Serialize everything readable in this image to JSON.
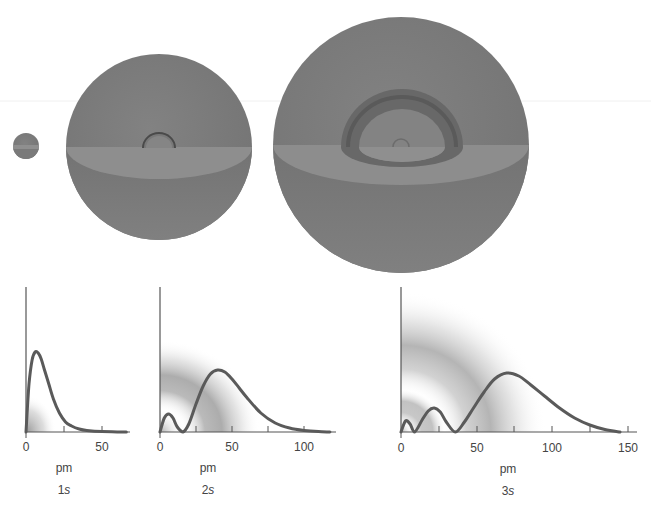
{
  "figure": {
    "colors": {
      "sphere": "#7d7d7d",
      "sphere_cut": "#8f8f8f",
      "sphere_shadow": "#5f5f5f",
      "curve": "#5a5a5a",
      "axis": "#555555",
      "text": "#444444"
    }
  },
  "orbitals": [
    {
      "id": "1s",
      "n": "1",
      "l": "s",
      "sphere": {
        "cx": 26,
        "cy": 146,
        "r": 13
      }
    },
    {
      "id": "2s",
      "n": "2",
      "l": "s",
      "sphere": {
        "cx": 159,
        "cy": 147,
        "r": 93
      }
    },
    {
      "id": "3s",
      "n": "3",
      "l": "s",
      "sphere": {
        "cx": 401,
        "cy": 145,
        "r": 128
      }
    }
  ],
  "chart_data": [
    {
      "type": "line",
      "title": "1s",
      "xlabel": "pm",
      "ylabel": "",
      "xticks": [
        0,
        25,
        50
      ],
      "xtick_labels": [
        "0",
        "",
        "50"
      ],
      "xlim": [
        0,
        68
      ],
      "x": [
        0,
        2,
        4,
        6,
        8,
        10,
        12,
        15,
        18,
        22,
        26,
        30,
        35,
        40,
        50,
        60,
        66
      ],
      "values": [
        0,
        48,
        72,
        80,
        79,
        73,
        63,
        48,
        33,
        19,
        10,
        6,
        3,
        1.5,
        0.4,
        0.1,
        0
      ],
      "grid": false,
      "legend": null
    },
    {
      "type": "line",
      "title": "2s",
      "xlabel": "pm",
      "ylabel": "",
      "xticks": [
        0,
        25,
        50,
        75,
        100
      ],
      "xtick_labels": [
        "0",
        "",
        "50",
        "",
        "100"
      ],
      "xlim": [
        0,
        122
      ],
      "x": [
        0,
        3,
        6,
        9,
        12,
        16,
        20,
        25,
        30,
        35,
        40,
        45,
        50,
        55,
        60,
        70,
        80,
        90,
        100,
        110,
        118
      ],
      "values": [
        0,
        14,
        18,
        14,
        5,
        0,
        8,
        28,
        46,
        58,
        62,
        60,
        53,
        44,
        35,
        19,
        9,
        4,
        1.5,
        0.4,
        0
      ],
      "grid": false,
      "legend": null
    },
    {
      "type": "line",
      "title": "3s",
      "xlabel": "pm",
      "ylabel": "",
      "xticks": [
        0,
        25,
        50,
        75,
        100,
        125,
        150
      ],
      "xtick_labels": [
        "0",
        "",
        "50",
        "",
        "100",
        "",
        "150"
      ],
      "xlim": [
        0,
        157
      ],
      "x": [
        0,
        3,
        6,
        9,
        14,
        18,
        22,
        26,
        30,
        36,
        42,
        48,
        55,
        62,
        70,
        78,
        86,
        95,
        105,
        115,
        125,
        135,
        145
      ],
      "values": [
        0,
        11,
        8,
        0,
        12,
        21,
        24,
        20,
        10,
        0,
        10,
        24,
        40,
        53,
        59,
        56,
        47,
        36,
        24,
        14,
        7,
        2.5,
        0
      ],
      "grid": false,
      "legend": null
    }
  ]
}
